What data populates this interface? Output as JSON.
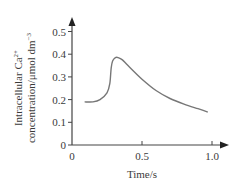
{
  "chart_data": {
    "type": "line",
    "title": "",
    "xlabel": "Time/s",
    "ylabel_line1": "Intracellular Ca",
    "ylabel_sup1": "2+",
    "ylabel_line2": "concentration/μmol dm",
    "ylabel_sup2": "−3",
    "xlim": [
      0,
      1.05
    ],
    "ylim": [
      0,
      0.52
    ],
    "x_ticks": [
      "0",
      "0.5",
      "1.0"
    ],
    "y_ticks": [
      "0",
      "0.1",
      "0.2",
      "0.3",
      "0.4",
      "0.5"
    ],
    "grid": false,
    "series": [
      {
        "name": "Intracellular Ca2+ concentration",
        "color": "#777777",
        "x": [
          0.09,
          0.15,
          0.2,
          0.25,
          0.27,
          0.28,
          0.29,
          0.31,
          0.33,
          0.36,
          0.4,
          0.5,
          0.6,
          0.7,
          0.8,
          0.9,
          0.97
        ],
        "y": [
          0.19,
          0.19,
          0.2,
          0.23,
          0.27,
          0.34,
          0.37,
          0.385,
          0.385,
          0.375,
          0.35,
          0.29,
          0.24,
          0.205,
          0.18,
          0.16,
          0.145
        ]
      }
    ]
  }
}
